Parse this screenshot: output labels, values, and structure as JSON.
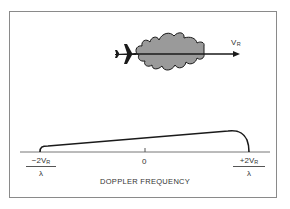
{
  "diagram": {
    "velocity_label": {
      "main": "V",
      "sub": "R"
    },
    "axis": {
      "left_label": {
        "numerator_prefix": "−2V",
        "numerator_sub": "R",
        "denominator": "λ"
      },
      "center_label": "0",
      "right_label": {
        "numerator_prefix": "+2V",
        "numerator_sub": "R",
        "denominator": "λ"
      },
      "title": "DOPPLER FREQUENCY"
    },
    "colors": {
      "lobe_fill": "#9a9a9a",
      "stroke": "#1a1a1a",
      "frame": "#8a8a8a"
    }
  }
}
